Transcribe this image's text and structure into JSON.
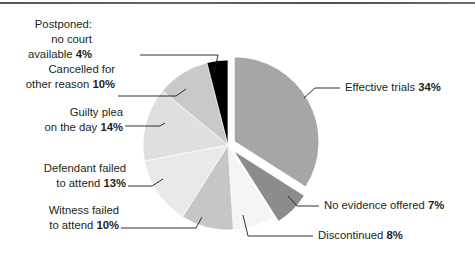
{
  "chart_data": {
    "type": "pie",
    "title": "",
    "subtitle": "",
    "xlabel": "",
    "ylabel": "",
    "legend_position": "callout-labels",
    "grid": false,
    "units": "percent",
    "total": 100,
    "categories": [
      "Effective trials",
      "No evidence offered",
      "Discontinued",
      "Witness failed to attend",
      "Defendant failed to attend",
      "Guilty plea on the day",
      "Cancelled for other reason",
      "Postponed: no court available"
    ],
    "values": [
      34,
      7,
      8,
      10,
      13,
      14,
      10,
      4
    ],
    "slices": [
      {
        "name": "Effective trials",
        "label_text": "Effective trials ",
        "value_text": "34%",
        "value": 34,
        "color": "#a6a6a6",
        "exploded": true
      },
      {
        "name": "No evidence offered",
        "label_text": "No evidence offered ",
        "value_text": "7%",
        "value": 7,
        "color": "#8c8c8c",
        "exploded": true
      },
      {
        "name": "Discontinued",
        "label_text": "Discontinued ",
        "value_text": "8%",
        "value": 8,
        "color": "#f4f4f4",
        "exploded": false
      },
      {
        "name": "Witness failed to attend",
        "label_text": "Witness failed to attend ",
        "value_text": "10%",
        "value": 10,
        "color": "#c6c6c6",
        "exploded": false
      },
      {
        "name": "Defendant failed to attend",
        "label_text": "Defendant failed to attend ",
        "value_text": "13%",
        "value": 13,
        "color": "#e9e9e9",
        "exploded": false
      },
      {
        "name": "Guilty plea on the day",
        "label_text": "Guilty plea on the day ",
        "value_text": "14%",
        "value": 14,
        "color": "#dfdfdf",
        "exploded": false
      },
      {
        "name": "Cancelled for other reason",
        "label_text": "Cancelled for other reason ",
        "value_text": "10%",
        "value": 10,
        "color": "#c9c9c9",
        "exploded": false
      },
      {
        "name": "Postponed: no court available",
        "label_text": "Postponed: no court available ",
        "value_text": "4%",
        "value": 4,
        "color": "#000000",
        "exploded": false
      }
    ]
  },
  "labels": {
    "postponed": {
      "line1": "Postponed:",
      "line2": "no court",
      "line3_text": "available ",
      "line3_value": "4%"
    },
    "cancelled": {
      "line1": "Cancelled for",
      "line2_text": "other reason ",
      "line2_value": "10%"
    },
    "guilty_plea": {
      "line1": "Guilty plea",
      "line2_text": "on the day ",
      "line2_value": "14%"
    },
    "defendant": {
      "line1": "Defendant failed",
      "line2_text": "to attend ",
      "line2_value": "13%"
    },
    "witness": {
      "line1": "Witness failed",
      "line2_text": "to attend ",
      "line2_value": "10%"
    },
    "effective": {
      "line1_text": "Effective trials ",
      "line1_value": "34%"
    },
    "no_evidence": {
      "line1_text": "No evidence offered ",
      "line1_value": "7%"
    },
    "discontinued": {
      "line1_text": "Discontinued ",
      "line1_value": "8%"
    }
  },
  "colors": {
    "background": "#ffffff",
    "text": "#231f20",
    "leader_line": "#1a1a1a"
  }
}
